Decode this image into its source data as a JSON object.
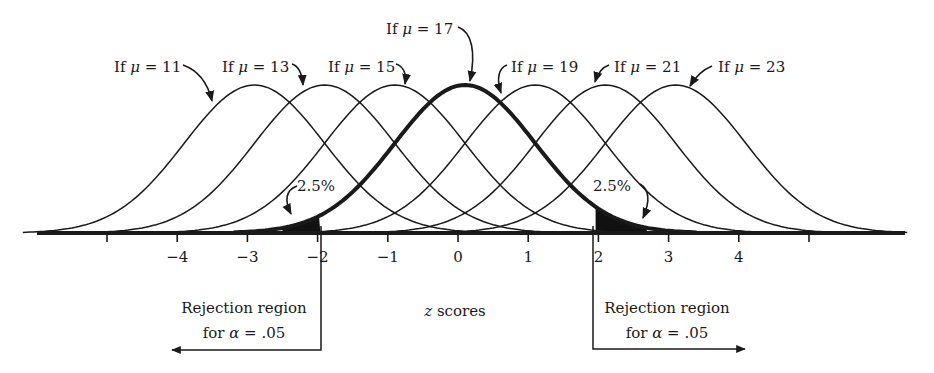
{
  "figure": {
    "type": "diagram",
    "colors": {
      "ink": "#1a1a1a",
      "background": "#ffffff"
    }
  },
  "curves": [
    {
      "label_prefix": "If ",
      "symbol": "μ",
      "label_suffix": " = 11",
      "mu": 11,
      "center_z": -3,
      "bold": false
    },
    {
      "label_prefix": "If ",
      "symbol": "μ",
      "label_suffix": " = 13",
      "mu": 13,
      "center_z": -2,
      "bold": false
    },
    {
      "label_prefix": "If ",
      "symbol": "μ",
      "label_suffix": " = 15",
      "mu": 15,
      "center_z": -1,
      "bold": false
    },
    {
      "label_prefix": "If ",
      "symbol": "μ",
      "label_suffix": " = 17",
      "mu": 17,
      "center_z": 0,
      "bold": true
    },
    {
      "label_prefix": "If ",
      "symbol": "μ",
      "label_suffix": " = 19",
      "mu": 19,
      "center_z": 1,
      "bold": false
    },
    {
      "label_prefix": "If ",
      "symbol": "μ",
      "label_suffix": " = 21",
      "mu": 21,
      "center_z": 2,
      "bold": false
    },
    {
      "label_prefix": "If ",
      "symbol": "μ",
      "label_suffix": " = 23",
      "mu": 23,
      "center_z": 3,
      "bold": false
    }
  ],
  "axis": {
    "title_var": "z",
    "title_rest": " scores",
    "ticks": [
      {
        "z": -5,
        "label": ""
      },
      {
        "z": -4,
        "label": "−4"
      },
      {
        "z": -3,
        "label": "−3"
      },
      {
        "z": -2,
        "label": "−2"
      },
      {
        "z": -1,
        "label": "−1"
      },
      {
        "z": 0,
        "label": "0"
      },
      {
        "z": 1,
        "label": "1"
      },
      {
        "z": 2,
        "label": "2"
      },
      {
        "z": 3,
        "label": "3"
      },
      {
        "z": 4,
        "label": "4"
      },
      {
        "z": 5,
        "label": ""
      }
    ]
  },
  "tails": {
    "left": {
      "percent_label": "2.5%",
      "critical_z": -1.96
    },
    "right": {
      "percent_label": "2.5%",
      "critical_z": 1.96
    }
  },
  "rejection_regions": {
    "left": {
      "line1": "Rejection region",
      "line2_prefix": "for ",
      "line2_symbol": "α",
      "line2_suffix": " = .05"
    },
    "right": {
      "line1": "Rejection region",
      "line2_prefix": "for ",
      "line2_symbol": "α",
      "line2_suffix": " = .05"
    }
  }
}
